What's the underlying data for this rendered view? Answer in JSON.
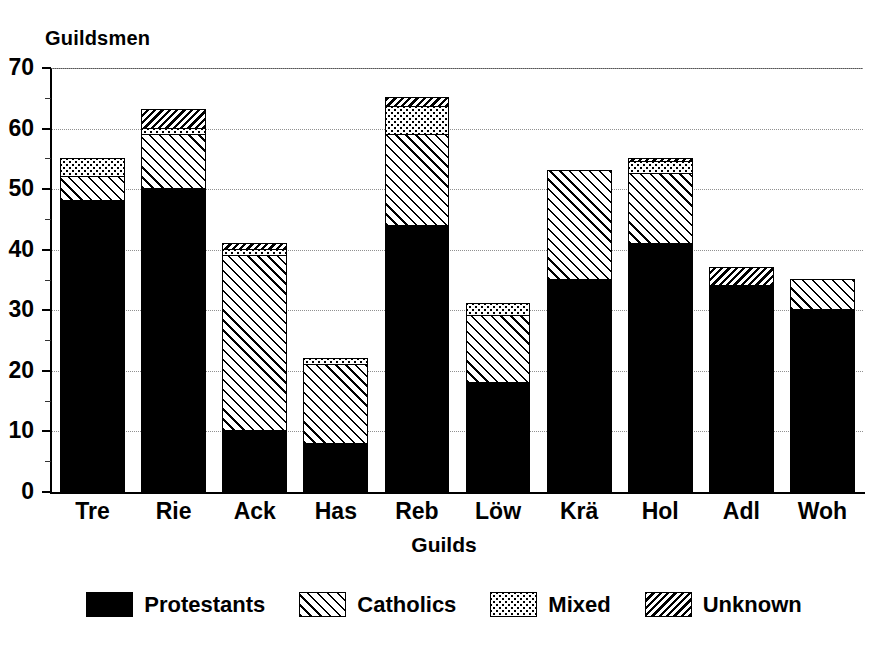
{
  "chart_data": {
    "type": "bar",
    "subtype": "stacked-bar",
    "title": "",
    "ylabel": "Guildsmen",
    "xlabel": "Guilds",
    "ylim": [
      0,
      70
    ],
    "yticks": [
      0,
      10,
      20,
      30,
      40,
      50,
      60,
      70
    ],
    "ytick_labels": [
      "0",
      "10",
      "20",
      "30",
      "40",
      "50",
      "60",
      "70"
    ],
    "yminor_ticks": [
      5,
      15,
      25,
      35,
      45,
      55,
      65
    ],
    "grid": "horizontal-dotted",
    "legend_position": "bottom-center",
    "categories": [
      "Tre",
      "Rie",
      "Ack",
      "Has",
      "Reb",
      "Löw",
      "Krä",
      "Hol",
      "Adl",
      "Woh"
    ],
    "series": [
      {
        "name": "Protestants",
        "pattern": "solid-black",
        "color": "#000000",
        "values": [
          48,
          50,
          10,
          8,
          44,
          18,
          35,
          41,
          34,
          30
        ]
      },
      {
        "name": "Catholics",
        "pattern": "diagonal-hatch",
        "color": "#ffffff",
        "values": [
          4,
          9,
          29,
          13,
          15,
          11,
          18,
          11.5,
          0,
          5
        ]
      },
      {
        "name": "Mixed",
        "pattern": "dotted-stipple",
        "color": "#ffffff",
        "values": [
          3,
          1,
          1,
          1,
          4.5,
          2,
          0,
          2,
          0,
          0
        ]
      },
      {
        "name": "Unknown",
        "pattern": "dense-hatch",
        "color": "#ffffff",
        "values": [
          0,
          3,
          1,
          0,
          1.5,
          0,
          0,
          0.5,
          3,
          0
        ]
      }
    ],
    "totals": [
      55,
      63,
      41,
      22,
      65,
      31,
      53,
      55,
      37,
      35
    ],
    "annotations": []
  },
  "legend": {
    "items": [
      {
        "label": "Protestants",
        "swatch": "solid-black-swatch"
      },
      {
        "label": "Catholics",
        "swatch": "diagonal-hatch-swatch"
      },
      {
        "label": "Mixed",
        "swatch": "dotted-stipple-swatch"
      },
      {
        "label": "Unknown",
        "swatch": "dense-hatch-swatch"
      }
    ]
  }
}
